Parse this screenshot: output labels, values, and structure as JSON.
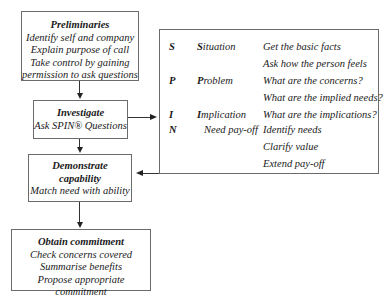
{
  "flow": {
    "preliminaries": {
      "title": "Preliminaries",
      "lines": [
        "Identify self and company",
        "Explain purpose of call",
        "Take control by gaining",
        "permission to ask questions"
      ]
    },
    "investigate": {
      "title": "Investigate",
      "subtitle": "Ask SPIN® Questions"
    },
    "demonstrate": {
      "title_line1": "Demonstrate",
      "title_line2": "capability",
      "subtitle": "Match need with ability"
    },
    "obtain": {
      "title": "Obtain commitment",
      "lines": [
        "Check concerns covered",
        "Summarise benefits",
        "Propose appropriate commitment"
      ]
    }
  },
  "spin": {
    "rows": [
      {
        "letter": "S",
        "word_initial": "S",
        "word_rest": "ituation",
        "desc": "Get the basic facts"
      },
      {
        "letter": "",
        "word_initial": "",
        "word_rest": "",
        "desc": "Ask how the person feels"
      },
      {
        "letter": "P",
        "word_initial": "P",
        "word_rest": "roblem",
        "desc": "What are the concerns?"
      },
      {
        "letter": "",
        "word_initial": "",
        "word_rest": "",
        "desc": "What are the implied needs?"
      },
      {
        "letter": "I",
        "word_initial": "I",
        "word_rest": "mplication",
        "desc": "What are the implications?"
      },
      {
        "letter": "N",
        "word_initial": "",
        "word_rest": "Need pay-off",
        "desc": "Identify needs"
      },
      {
        "letter": "",
        "word_initial": "",
        "word_rest": "",
        "desc": "Clarify value"
      },
      {
        "letter": "",
        "word_initial": "",
        "word_rest": "",
        "desc": "Extend pay-off"
      }
    ]
  }
}
